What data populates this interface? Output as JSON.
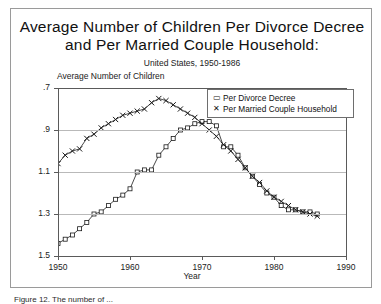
{
  "figure": {
    "title_line1": "Average Number of Children Per Divorce Decree",
    "title_line2": "and Per Married Couple Household:",
    "subtitle": "United States, 1950-1986",
    "caption": "Figure 12. The number of ...",
    "frame_color": "#9a9a9a"
  },
  "legend": {
    "position": "top-right",
    "entries": [
      {
        "marker": "square-marker",
        "glyph": "▭",
        "label": "Per Divorce Decree"
      },
      {
        "marker": "x-marker",
        "glyph": "✕",
        "label": "Per Married Couple Household"
      }
    ]
  },
  "axes": {
    "y_title": "Average Number of Children",
    "x_title": "Year",
    "y_ticks": [
      "1.5",
      "1.3",
      "1.1",
      ".9",
      ".7"
    ],
    "x_ticks": [
      "1950",
      "1960",
      "1970",
      "1980",
      "1990"
    ]
  },
  "chart_data": {
    "type": "line",
    "title": "Average Number of Children Per Divorce Decree and Per Married Couple Household:",
    "subtitle": "United States, 1950-1986",
    "xlabel": "Year",
    "ylabel": "Average Number of Children",
    "xlim": [
      1950,
      1990
    ],
    "ylim": [
      0.7,
      1.5
    ],
    "grid": true,
    "yticks": [
      0.7,
      0.9,
      1.1,
      1.3,
      1.5
    ],
    "xticks": [
      1950,
      1960,
      1970,
      1980,
      1990
    ],
    "legend_position": "upper right",
    "series": [
      {
        "name": "Per Divorce Decree",
        "marker": "square",
        "x": [
          1950,
          1951,
          1952,
          1953,
          1954,
          1955,
          1956,
          1957,
          1958,
          1959,
          1960,
          1961,
          1962,
          1963,
          1964,
          1965,
          1966,
          1967,
          1968,
          1969,
          1970,
          1971,
          1972,
          1973,
          1974,
          1975,
          1976,
          1977,
          1978,
          1979,
          1980,
          1981,
          1982,
          1983,
          1984,
          1985,
          1986
        ],
        "y": [
          0.76,
          0.78,
          0.8,
          0.83,
          0.86,
          0.9,
          0.91,
          0.94,
          0.97,
          0.99,
          1.02,
          1.1,
          1.11,
          1.11,
          1.18,
          1.22,
          1.26,
          1.3,
          1.31,
          1.33,
          1.34,
          1.34,
          1.32,
          1.22,
          1.22,
          1.18,
          1.12,
          1.08,
          1.04,
          1.0,
          0.98,
          0.94,
          0.92,
          0.92,
          0.91,
          0.91,
          0.9
        ],
        "color": "#1a1a1a"
      },
      {
        "name": "Per Married Couple Household",
        "marker": "x",
        "x": [
          1950,
          1951,
          1952,
          1953,
          1954,
          1955,
          1956,
          1957,
          1958,
          1959,
          1960,
          1961,
          1962,
          1963,
          1964,
          1965,
          1966,
          1967,
          1968,
          1969,
          1970,
          1971,
          1972,
          1973,
          1974,
          1975,
          1976,
          1977,
          1978,
          1979,
          1980,
          1981,
          1982,
          1983,
          1984,
          1985,
          1986
        ],
        "y": [
          1.14,
          1.18,
          1.2,
          1.21,
          1.26,
          1.28,
          1.31,
          1.33,
          1.35,
          1.37,
          1.38,
          1.39,
          1.4,
          1.43,
          1.45,
          1.44,
          1.42,
          1.4,
          1.38,
          1.36,
          1.33,
          1.3,
          1.27,
          1.23,
          1.2,
          1.16,
          1.12,
          1.08,
          1.05,
          1.01,
          0.98,
          0.96,
          0.94,
          0.92,
          0.91,
          0.9,
          0.89
        ],
        "color": "#1a1a1a"
      }
    ]
  }
}
